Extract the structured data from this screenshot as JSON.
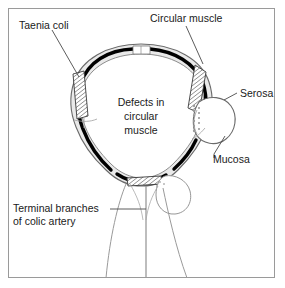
{
  "figure": {
    "frame_color": "#9a9a9a",
    "background": "#ffffff"
  },
  "labels": {
    "taenia_coli": "Taenia coli",
    "circular_muscle": "Circular muscle",
    "serosa": "Serosa",
    "mucosa": "Mucosa",
    "terminal_branches_line1": "Terminal branches",
    "terminal_branches_line2": "of colic artery",
    "defects_line1": "Defects in",
    "defects_line2": "circular",
    "defects_line3": "muscle"
  },
  "colors": {
    "wall_fill": "#e8e8e8",
    "wall_stroke": "#5a5a5a",
    "circular_muscle": "#000000",
    "lumen": "#ffffff",
    "hatch": "#3a3a3a",
    "vessel": "#8a8a8a",
    "text": "#1a1a1a"
  },
  "structures": {
    "taenia_bands": 3,
    "diverticulum_position": "right",
    "defect_marks": "stippled-dots",
    "vessel_branches": 3
  }
}
